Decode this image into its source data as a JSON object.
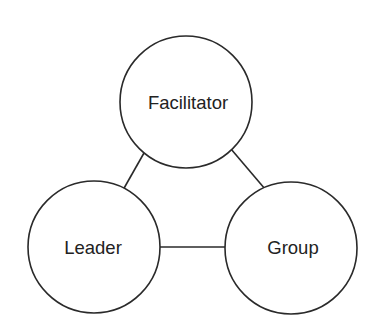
{
  "diagram": {
    "type": "triad",
    "nodes": [
      {
        "id": "facilitator",
        "label": "Facilitator",
        "cx": 186,
        "cy": 102,
        "r": 66
      },
      {
        "id": "leader",
        "label": "Leader",
        "cx": 94,
        "cy": 247,
        "r": 66
      },
      {
        "id": "group",
        "label": "Group",
        "cx": 291,
        "cy": 248,
        "r": 66
      }
    ],
    "edges": [
      {
        "from": "facilitator",
        "to": "leader"
      },
      {
        "from": "facilitator",
        "to": "group"
      },
      {
        "from": "leader",
        "to": "group"
      }
    ],
    "colors": {
      "stroke": "#2a2a2a",
      "text": "#222222",
      "background": "#ffffff"
    }
  }
}
